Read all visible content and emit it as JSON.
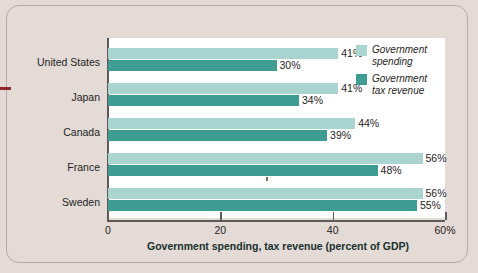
{
  "figure": {
    "background_color": "#e4dad6",
    "plot_background_color": "#ffffff",
    "margin_dash_color": "#8e2a2f"
  },
  "legend": {
    "position": "inside-top-right",
    "entries": [
      {
        "label_line1": "Government",
        "label_line2": "spending",
        "color": "#a9d4cf",
        "swatch_name": "legend-swatch-spending"
      },
      {
        "label_line1": "Government",
        "label_line2": "tax revenue",
        "color": "#3f9c92",
        "swatch_name": "legend-swatch-revenue"
      }
    ]
  },
  "axis": {
    "x_title": "Government spending, tax revenue (percent of GDP)",
    "ticks": [
      {
        "value": 0,
        "label": "0"
      },
      {
        "value": 20,
        "label": "20"
      },
      {
        "value": 40,
        "label": "40"
      },
      {
        "value": 60,
        "label": "60%"
      }
    ]
  },
  "chart_data": {
    "type": "bar",
    "orientation": "horizontal",
    "title": "",
    "subtitle": "",
    "xlabel": "Government spending, tax revenue (percent of GDP)",
    "ylabel": "",
    "xlim": [
      0,
      60
    ],
    "xticks": [
      0,
      20,
      40,
      60
    ],
    "xtick_labels": [
      "0",
      "20",
      "40",
      "60%"
    ],
    "grid": false,
    "legend_position": "inside-top-right",
    "categories": [
      "United States",
      "Japan",
      "Canada",
      "France",
      "Sweden"
    ],
    "series": [
      {
        "name": "Government spending",
        "color": "#a9d4cf",
        "values": [
          41,
          41,
          44,
          56,
          56
        ],
        "value_labels": [
          "41%",
          "41%",
          "44%",
          "56%",
          "56%"
        ]
      },
      {
        "name": "Government tax revenue",
        "color": "#3f9c92",
        "values": [
          30,
          34,
          39,
          48,
          55
        ],
        "value_labels": [
          "30%",
          "34%",
          "39%",
          "48%",
          "55%"
        ]
      }
    ],
    "units": "percent of GDP"
  }
}
